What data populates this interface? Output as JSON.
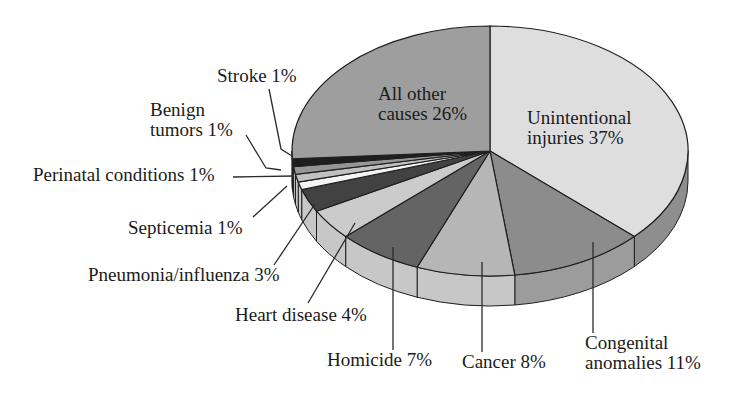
{
  "figure": {
    "background": "#ffffff",
    "text_color": "#1b1b1b"
  },
  "chart_data": {
    "type": "pie",
    "style": "3d-elliptical",
    "unit": "percent",
    "total": 100,
    "direction": "clockwise-from-top",
    "outline_color": "#1f1f1f",
    "leader_line_color": "#2b2b2b",
    "slices": [
      {
        "id": "unintentional-injuries",
        "label": "Unintentional injuries",
        "value": 37,
        "display": "Unintentional injuries 37%",
        "color": "#dedede",
        "rim_color": "#8e8e8e",
        "label_position": "inside"
      },
      {
        "id": "congenital-anomalies",
        "label": "Congenital anomalies",
        "value": 11,
        "display": "Congenital anomalies 11%",
        "color": "#8c8c8c",
        "rim_color": "#9c9c9c",
        "label_position": "outside"
      },
      {
        "id": "cancer",
        "label": "Cancer",
        "value": 8,
        "display": "Cancer 8%",
        "color": "#b6b6b6",
        "rim_color": "#c7c7c7",
        "label_position": "outside"
      },
      {
        "id": "homicide",
        "label": "Homicide",
        "value": 7,
        "display": "Homicide 7%",
        "color": "#646464",
        "rim_color": "#c7c7c7",
        "label_position": "outside"
      },
      {
        "id": "heart-disease",
        "label": "Heart disease",
        "value": 4,
        "display": "Heart disease 4%",
        "color": "#cbcbcb",
        "rim_color": "#c7c7c7",
        "label_position": "outside"
      },
      {
        "id": "pneumonia-influenza",
        "label": "Pneumonia/influenza",
        "value": 3,
        "display": "Pneumonia/influenza 3%",
        "color": "#424242",
        "rim_color": "#c7c7c7",
        "label_position": "outside"
      },
      {
        "id": "septicemia",
        "label": "Septicemia",
        "value": 1,
        "display": "Septicemia 1%",
        "color": "#f4f4f4",
        "rim_color": "#c7c7c7",
        "label_position": "outside"
      },
      {
        "id": "perinatal-conditions",
        "label": "Perinatal conditions",
        "value": 1,
        "display": "Perinatal conditions 1%",
        "color": "#c0c0c0",
        "rim_color": "#c7c7c7",
        "label_position": "outside"
      },
      {
        "id": "benign-tumors",
        "label": "Benign tumors",
        "value": 1,
        "display": "Benign tumors 1%",
        "color": "#959595",
        "rim_color": "#c7c7c7",
        "label_position": "outside"
      },
      {
        "id": "stroke",
        "label": "Stroke",
        "value": 1,
        "display": "Stroke 1%",
        "color": "#1e1e1e",
        "rim_color": "#c7c7c7",
        "label_position": "outside"
      },
      {
        "id": "all-other-causes",
        "label": "All other causes",
        "value": 26,
        "display": "All other causes 26%",
        "color": "#9e9e9e",
        "rim_color": "#9e9e9e",
        "label_position": "inside"
      }
    ]
  }
}
